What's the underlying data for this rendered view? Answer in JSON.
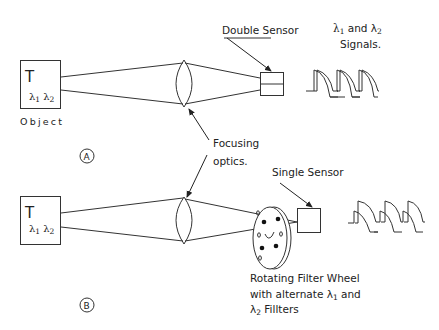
{
  "diagram": {
    "panel_a": {
      "marker": "A",
      "object": {
        "title": "T",
        "lambda1": "λ",
        "sub1": "1",
        "lambda2": "λ",
        "sub2": "2",
        "label": "Object"
      },
      "sensor_label": "Double Sensor",
      "signals_label_line1_prefix": "λ",
      "signals_label_line1_sub1": "1",
      "signals_label_line1_mid": " and λ",
      "signals_label_line1_sub2": "2",
      "signals_label_line2": "Signals."
    },
    "shared": {
      "optics_label_line1": "Focusing",
      "optics_label_line2": "optics."
    },
    "panel_b": {
      "marker": "B",
      "object": {
        "title": "T",
        "lambda1": "λ",
        "sub1": "1",
        "lambda2": "λ",
        "sub2": "2"
      },
      "sensor_label": "Single Sensor",
      "wheel_label_line1": "Rotating Filter Wheel",
      "wheel_label_line2_prefix": "with alternate  λ",
      "wheel_label_line2_sub": "1",
      "wheel_label_line2_suffix": " and",
      "wheel_label_line3_prefix": "λ",
      "wheel_label_line3_sub": "2",
      "wheel_label_line3_suffix": " Fillters"
    }
  }
}
